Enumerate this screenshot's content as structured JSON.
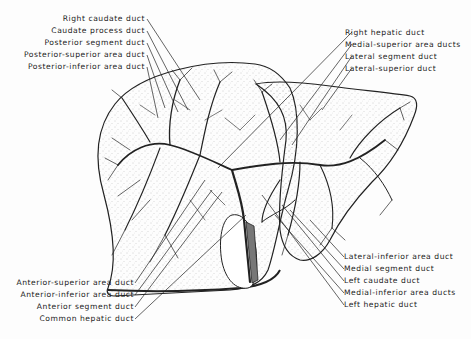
{
  "diagram": {
    "labels_left_top": [
      {
        "text": "Right caudate duct"
      },
      {
        "text": "Caudate process duct"
      },
      {
        "text": "Posterior segment duct"
      },
      {
        "text": "Posterior-superior area duct"
      },
      {
        "text": "Posterior-inferior area duct"
      }
    ],
    "labels_right_top": [
      {
        "text": "Right hepatic duct"
      },
      {
        "text": "Medial-superior area ducts"
      },
      {
        "text": "Lateral segment duct"
      },
      {
        "text": "Lateral-superior duct"
      }
    ],
    "labels_left_bottom": [
      {
        "text": "Anterior-superior area duct"
      },
      {
        "text": "Anterior-inferior area duct"
      },
      {
        "text": "Anterior segment duct"
      },
      {
        "text": "Common hepatic duct"
      }
    ],
    "labels_right_bottom": [
      {
        "text": "Lateral-inferior area duct"
      },
      {
        "text": "Medial segment duct"
      },
      {
        "text": "Left caudate duct"
      },
      {
        "text": "Medial-inferior area ducts"
      },
      {
        "text": "Left hepatic duct"
      }
    ],
    "colors": {
      "ink": "#222222",
      "background": "#fdfdfd",
      "stipple": "#9a9a9a"
    }
  }
}
